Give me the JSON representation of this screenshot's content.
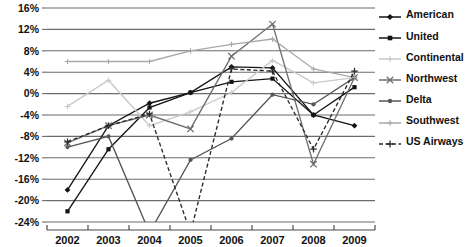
{
  "chart_data": {
    "type": "line",
    "title": "",
    "xlabel": "",
    "ylabel": "",
    "x": [
      "2002",
      "2003",
      "2004",
      "2005",
      "2006",
      "2007",
      "2008",
      "2009"
    ],
    "categories": [
      "2002",
      "2003",
      "2004",
      "2005",
      "2006",
      "2007",
      "2008",
      "2009"
    ],
    "ylim": [
      -24,
      16
    ],
    "yticks": [
      16,
      12,
      8,
      4,
      0,
      -4,
      -8,
      -12,
      -16,
      -20,
      -24
    ],
    "ytick_labels": [
      "16%",
      "12%",
      "8%",
      "4%",
      "0%",
      "-4%",
      "-8%",
      "-12%",
      "-16%",
      "-20%",
      "-24%"
    ],
    "xtick_labels": [
      "2002",
      "2003",
      "2004",
      "2005",
      "2006",
      "2007",
      "2008",
      "2009"
    ],
    "grid": true,
    "legend_position": "right",
    "series": [
      {
        "name": "American",
        "color": "#141414",
        "marker": "diamond",
        "dash": "solid",
        "values": [
          -18.0,
          -6.0,
          -1.8,
          0.2,
          5.0,
          4.8,
          -4.0,
          -6.0
        ]
      },
      {
        "name": "United",
        "color": "#141414",
        "marker": "square",
        "dash": "solid",
        "values": [
          -22.0,
          -10.4,
          -2.6,
          0.2,
          2.2,
          2.8,
          -4.0,
          1.2
        ]
      },
      {
        "name": "Continental",
        "color": "#c9c9c9",
        "marker": "tick",
        "dash": "solid",
        "values": [
          -2.4,
          2.5,
          -6.0,
          -3.4,
          0.2,
          6.2,
          2.0,
          3.0
        ]
      },
      {
        "name": "Northwest",
        "color": "#6e6e6e",
        "marker": "cross",
        "dash": "solid",
        "values": [
          -9.2,
          -6.0,
          -4.0,
          -6.6,
          7.0,
          13.0,
          -13.2,
          3.0
        ]
      },
      {
        "name": "Delta",
        "color": "#565656",
        "marker": "dot",
        "dash": "solid",
        "values": [
          -10.0,
          -8.0,
          -26.0,
          -12.4,
          -8.4,
          -0.2,
          -2.0,
          3.0
        ]
      },
      {
        "name": "Southwest",
        "color": "#a8a8a8",
        "marker": "tick",
        "dash": "solid",
        "values": [
          6.0,
          6.0,
          6.0,
          8.0,
          9.2,
          10.2,
          4.6,
          3.0
        ]
      },
      {
        "name": "US Airways",
        "color": "#2a2a2a",
        "marker": "plus",
        "dash": "dashed",
        "values": [
          -9.0,
          -6.0,
          -3.8,
          -26.0,
          4.6,
          4.2,
          -10.4,
          4.2
        ]
      }
    ]
  },
  "legend": {
    "items": [
      {
        "label": "American"
      },
      {
        "label": "United"
      },
      {
        "label": "Continental"
      },
      {
        "label": "Northwest"
      },
      {
        "label": "Delta"
      },
      {
        "label": "Southwest"
      },
      {
        "label": "US Airways"
      }
    ]
  }
}
